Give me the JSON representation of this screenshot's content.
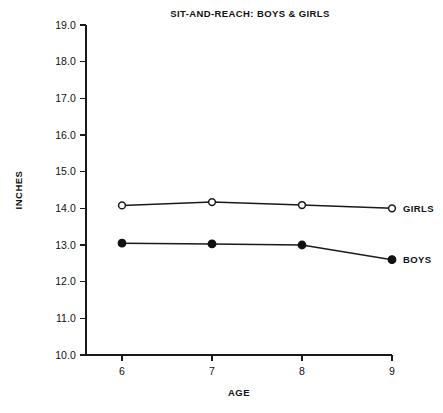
{
  "chart_data": {
    "type": "line",
    "title": "SIT-AND-REACH: BOYS & GIRLS",
    "xlabel": "AGE",
    "ylabel": "INCHES",
    "x": [
      6,
      7,
      8,
      9
    ],
    "xtick_labels": [
      "6",
      "7",
      "8",
      "9"
    ],
    "ytick_labels": [
      "10.0",
      "11.0",
      "12.0",
      "13.0",
      "14.0",
      "15.0",
      "16.0",
      "17.0",
      "18.0",
      "19.0"
    ],
    "ytick_values": [
      10.0,
      11.0,
      12.0,
      13.0,
      14.0,
      15.0,
      16.0,
      17.0,
      18.0,
      19.0
    ],
    "xlim": [
      5.6,
      9.0
    ],
    "ylim": [
      10.0,
      19.0
    ],
    "grid": false,
    "legend_position": "right-inline",
    "series": [
      {
        "name": "GIRLS",
        "label": "GIRLS",
        "marker": "open-circle",
        "color": "#111111",
        "values": [
          14.08,
          14.17,
          14.09,
          14.0
        ]
      },
      {
        "name": "BOYS",
        "label": "BOYS",
        "marker": "filled-circle",
        "color": "#111111",
        "values": [
          13.05,
          13.03,
          13.0,
          12.6
        ]
      }
    ]
  }
}
